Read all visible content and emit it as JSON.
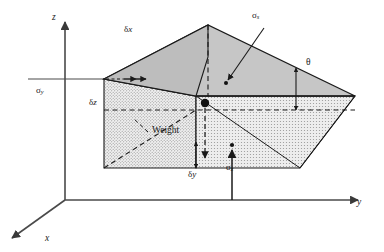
{
  "figure": {
    "type": "mechanics-wedge-free-body-diagram",
    "background_color": "#ffffff",
    "line_color": "#1a1a1a",
    "axis_color": "#4a4a4a",
    "top_face_fill": "#c8c8c8",
    "front_face_fill": "#e2e2e2",
    "side_face_fill": "#d0d0d0"
  },
  "axes": {
    "z": {
      "label": "z",
      "name": "z-axis"
    },
    "y": {
      "label": "y",
      "name": "y-axis"
    },
    "x": {
      "label": "x",
      "name": "x-axis"
    }
  },
  "labels": {
    "delta_x": {
      "symbol": "δ",
      "var": "x"
    },
    "delta_y": {
      "symbol": "δ",
      "var": "y"
    },
    "delta_z": {
      "symbol": "δ",
      "var": "z"
    },
    "sigma_y": {
      "symbol": "σ",
      "sub": "y"
    },
    "sigma_z": {
      "symbol": "σ",
      "sub": "z"
    },
    "sigma_s": {
      "symbol": "σ",
      "sub": "s"
    },
    "theta": {
      "symbol": "θ"
    },
    "weight": {
      "text": "Weight"
    }
  }
}
